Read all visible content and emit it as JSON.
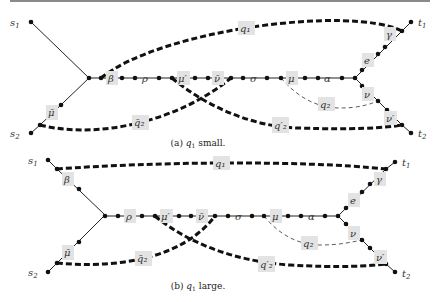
{
  "panels": [
    {
      "id": "a",
      "caption_prefix": "(a) ",
      "caption_var": "q",
      "caption_sub": "1",
      "caption_suffix": " small.",
      "terminals": {
        "s1": "s",
        "s1_sub": "1",
        "s2": "s",
        "s2_sub": "2",
        "t1": "t",
        "t1_sub": "1",
        "t2": "t",
        "t2_sub": "2"
      },
      "labels": {
        "beta": "β",
        "rho": "ρ",
        "mu_prime": "μ′",
        "nu_bar": "ν̄",
        "sigma": "σ",
        "mu": "μ",
        "alpha": "α",
        "e": "e",
        "gamma": "γ",
        "nu": "ν",
        "nu_prime": "ν′",
        "mu_bar": "μ̄",
        "q1": "q₁",
        "q2_bar": "q̄₂",
        "q2_prime": "q′₂",
        "q2": "q₂"
      }
    },
    {
      "id": "b",
      "caption_prefix": "(b) ",
      "caption_var": "q",
      "caption_sub": "1",
      "caption_suffix": " large.",
      "terminals": {
        "s1": "s",
        "s1_sub": "1",
        "s2": "s",
        "s2_sub": "2",
        "t1": "t",
        "t1_sub": "1",
        "t2": "t",
        "t2_sub": "2"
      },
      "labels": {
        "beta": "β",
        "rho": "ρ",
        "mu_prime": "μ′",
        "nu_bar": "ν̄",
        "sigma": "σ",
        "mu": "μ",
        "alpha": "α",
        "e": "e",
        "gamma": "γ",
        "nu": "ν",
        "nu_prime": "ν′",
        "mu_bar": "μ̄",
        "q1": "q₁",
        "q2_bar": "q̄₂",
        "q2_prime": "q′₂",
        "q2": "q₂"
      }
    }
  ]
}
